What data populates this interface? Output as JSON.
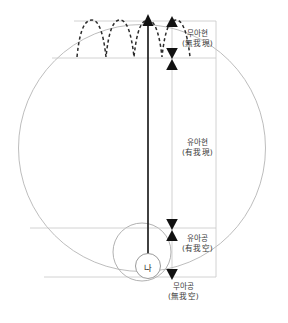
{
  "diagram": {
    "title": "",
    "colors": {
      "outer_circle": "#b9b9b9",
      "inner_circle": "#9e9e9e",
      "rect_line": "#c2c2c2",
      "hline": "#c9c9c9",
      "axis": "#262626",
      "marker": "#1a1a1a",
      "wave": "#2b2b2b",
      "label_text": "#3a3a3a",
      "background": "#ffffff"
    },
    "center_node": {
      "label": "나",
      "cx": 142,
      "cy": 265,
      "r": 13
    },
    "outer_circle": {
      "cx": 142,
      "cy": 148,
      "r": 134
    },
    "big_inner_circle": {
      "cx": 142,
      "cy": 252,
      "r": 30
    },
    "axis_arrow": {
      "x": 148,
      "y_top": 18,
      "y_bottom": 277
    },
    "stage_labels": [
      {
        "id": "mua-hyeon",
        "korean": "무아현",
        "hanja": "(無我現)",
        "x": 182,
        "y": 32,
        "band_top": 21,
        "band_bottom": 58
      },
      {
        "id": "yua-hyeon",
        "korean": "유아현",
        "hanja": "(有我現)",
        "x": 182,
        "y": 139,
        "band_top": 68,
        "band_bottom": 228
      },
      {
        "id": "yua-gong",
        "korean": "유아공",
        "hanja": "(有我空)",
        "x": 182,
        "y": 235,
        "band_top": 228,
        "band_bottom": 277
      },
      {
        "id": "mua-gong",
        "korean": "무아공",
        "hanja": "(無我空)",
        "x": 170,
        "y": 283,
        "band_top": 277,
        "band_bottom": 295
      }
    ],
    "horizontal_lines": [
      {
        "id": "hline-top",
        "y": 21,
        "x1": 74,
        "x2": 216
      },
      {
        "id": "hline-second",
        "y": 58,
        "x1": 52,
        "x2": 216
      },
      {
        "id": "hline-third",
        "y": 228,
        "x1": 30,
        "x2": 216
      },
      {
        "id": "hline-bottom",
        "y": 277,
        "x1": 44,
        "x2": 216
      }
    ],
    "rect_right_edge": {
      "x": 216,
      "y1": 21,
      "y2": 277
    },
    "markers": [
      {
        "id": "marker-up-top",
        "dir": "up",
        "x": 172,
        "y": 23
      },
      {
        "id": "marker-down-mua-hyeon",
        "dir": "down",
        "x": 172,
        "y": 52
      },
      {
        "id": "marker-up-yua-hyeon",
        "dir": "up",
        "x": 172,
        "y": 66
      },
      {
        "id": "marker-down-yua-hyeon",
        "dir": "down",
        "x": 172,
        "y": 228
      },
      {
        "id": "marker-up-yua-gong",
        "dir": "up",
        "x": 172,
        "y": 241
      },
      {
        "id": "marker-down-bottom",
        "dir": "down",
        "x": 172,
        "y": 277
      }
    ],
    "wave": {
      "id": "oscillation-wave",
      "style": "dashed",
      "peaks": 5,
      "x_start": 77,
      "x_end": 196,
      "y_baseline": 58,
      "y_peak": 20
    }
  }
}
